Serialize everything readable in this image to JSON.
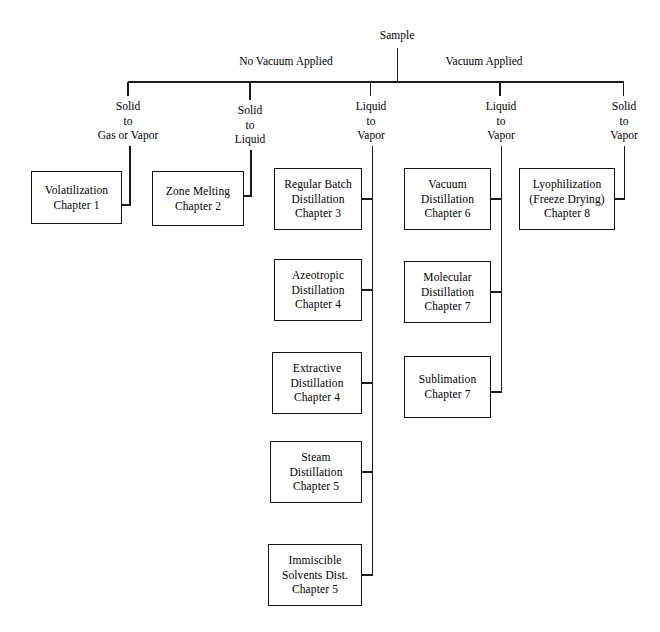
{
  "diagram": {
    "root": {
      "label": "Sample"
    },
    "branch_labels": [
      {
        "id": "no-vacuum",
        "label": "No Vacuum Applied"
      },
      {
        "id": "vacuum",
        "label": "Vacuum Applied"
      }
    ],
    "transitions": [
      {
        "id": "solid-to-gas-or-vapor",
        "lines": [
          "Solid",
          "to",
          "Gas or Vapor"
        ]
      },
      {
        "id": "solid-to-liquid",
        "lines": [
          "Solid",
          "to",
          "Liquid"
        ]
      },
      {
        "id": "liquid-to-vapor-no-vacuum",
        "lines": [
          "Liquid",
          "to",
          "Vapor"
        ]
      },
      {
        "id": "liquid-to-vapor-vacuum",
        "lines": [
          "Liquid",
          "to",
          "Vapor"
        ]
      },
      {
        "id": "solid-to-vapor-vacuum",
        "lines": [
          "Solid",
          "to",
          "Vapor"
        ]
      }
    ],
    "methods": [
      {
        "id": "volatilization",
        "lines": [
          "Volatilization",
          "Chapter 1"
        ]
      },
      {
        "id": "zone-melting",
        "lines": [
          "Zone Melting",
          "Chapter 2"
        ]
      },
      {
        "id": "regular-batch-distillation",
        "lines": [
          "Regular Batch",
          "Distillation",
          "Chapter 3"
        ]
      },
      {
        "id": "azeotropic-distillation",
        "lines": [
          "Azeotropic",
          "Distillation",
          "Chapter 4"
        ]
      },
      {
        "id": "extractive-distillation",
        "lines": [
          "Extractive",
          "Distillation",
          "Chapter  4"
        ]
      },
      {
        "id": "steam-distillation",
        "lines": [
          "Steam",
          "Distillation",
          "Chapter  5"
        ]
      },
      {
        "id": "immiscible-solvents-distillation",
        "lines": [
          "Immiscible",
          "Solvents Dist.",
          "Chapter  5"
        ]
      },
      {
        "id": "vacuum-distillation",
        "lines": [
          "Vacuum",
          "Distillation",
          "Chapter 6"
        ]
      },
      {
        "id": "molecular-distillation",
        "lines": [
          "Molecular",
          "Distillation",
          "Chapter  7"
        ]
      },
      {
        "id": "sublimation",
        "lines": [
          "Sublimation",
          "Chapter  7"
        ]
      },
      {
        "id": "lyophilization",
        "lines": [
          "Lyophilization",
          "(Freeze Drying)",
          "Chapter  8"
        ]
      }
    ],
    "colors": {
      "line": "#1a1a1a",
      "box_border": "#111111",
      "background": "#ffffff",
      "text": "#000000"
    }
  }
}
